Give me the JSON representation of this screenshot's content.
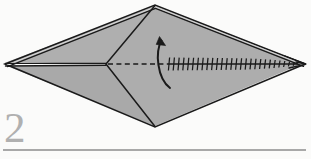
{
  "page": {
    "background_color": "#fbfbfa"
  },
  "step": {
    "number": "2",
    "number_color": "#b0b0b0",
    "rule_color": "#a8a8a8"
  },
  "figure": {
    "name": "kite-shaped folded paper",
    "fill_color": "#ababab",
    "highlight_color": "#c2c2c2",
    "outline_color": "#1a1a1a",
    "paper_white": "#fdfdfd",
    "vertices": {
      "left_tip": [
        5,
        64
      ],
      "top": [
        155,
        5
      ],
      "right_tip": [
        305,
        64
      ],
      "bottom": [
        155,
        127
      ],
      "center": [
        106,
        64
      ]
    },
    "fold_lines": [
      {
        "name": "valley-fold-dashed",
        "style": "dashed",
        "from": [
          107,
          64
        ],
        "to": [
          168,
          64
        ]
      },
      {
        "name": "mountain-fold-hatched",
        "style": "hatched",
        "from": [
          168,
          64
        ],
        "to": [
          297,
          64
        ],
        "tick_count": 27
      }
    ],
    "arrow": {
      "name": "rotate-fold-arrow",
      "type": "curved",
      "direction": "up-left",
      "start": [
        170,
        88
      ],
      "end": [
        160,
        38
      ]
    }
  }
}
